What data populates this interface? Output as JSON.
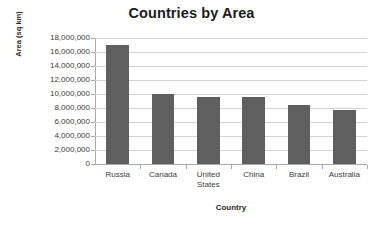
{
  "chart_data": {
    "type": "bar",
    "title": "Countries by Area",
    "xlabel": "Country",
    "ylabel": "Area (sq km)",
    "categories": [
      "Russia",
      "Canada",
      "United States",
      "China",
      "Brazil",
      "Australia"
    ],
    "values": [
      17000000,
      10000000,
      9600000,
      9600000,
      8500000,
      7700000
    ],
    "ylim": [
      0,
      18000000
    ],
    "ytick_values": [
      0,
      2000000,
      4000000,
      6000000,
      8000000,
      10000000,
      12000000,
      14000000,
      16000000,
      18000000
    ],
    "ytick_labels": [
      "0",
      "2,000,000",
      "4,000,000",
      "6,000,000",
      "8,000,000",
      "10,000,000",
      "12,000,000",
      "14,000,000",
      "16,000,000",
      "18,000,000"
    ],
    "grid": true,
    "grid_axis": "y",
    "legend": false,
    "bar_color": "#5f5f5f",
    "gridline_color": "#d2d2d2",
    "axis_color": "#a8a8a8",
    "background_color": "#ffffff",
    "bar_width_ratio": 0.5
  }
}
